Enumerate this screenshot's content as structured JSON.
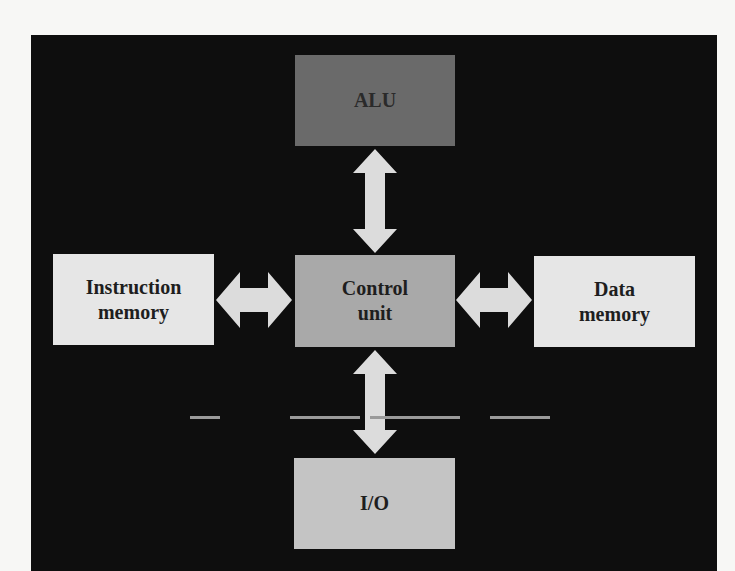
{
  "diagram": {
    "type": "block-diagram",
    "background_color": "#0e0e0e",
    "blocks": {
      "alu": {
        "label": "ALU",
        "color": "#6a6a6a"
      },
      "control_unit": {
        "label_line1": "Control",
        "label_line2": "unit",
        "color": "#a9a9a9"
      },
      "instruction_memory": {
        "label_line1": "Instruction",
        "label_line2": "memory",
        "color": "#e6e6e6"
      },
      "data_memory": {
        "label_line1": "Data",
        "label_line2": "memory",
        "color": "#e6e6e6"
      },
      "io": {
        "label": "I/O",
        "color": "#c4c4c4"
      }
    },
    "connections": [
      {
        "from": "control_unit",
        "to": "alu",
        "direction": "bidirectional"
      },
      {
        "from": "control_unit",
        "to": "io",
        "direction": "bidirectional"
      },
      {
        "from": "control_unit",
        "to": "instruction_memory",
        "direction": "bidirectional"
      },
      {
        "from": "control_unit",
        "to": "data_memory",
        "direction": "bidirectional"
      }
    ],
    "arrow_color": "#dcdcdc"
  },
  "caption": {
    "note": "caption text cut off at image bottom edge; not legible"
  }
}
